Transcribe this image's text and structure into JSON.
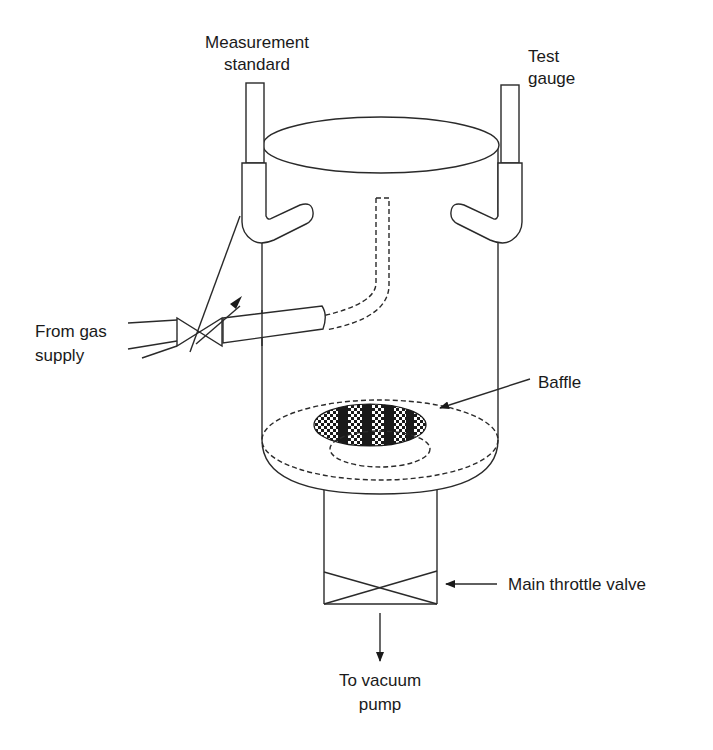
{
  "diagram": {
    "labels": {
      "measurement_standard_line1": "Measurement",
      "measurement_standard_line2": "standard",
      "test_gauge_line1": "Test",
      "test_gauge_line2": "gauge",
      "gas_supply_line1": "From gas",
      "gas_supply_line2": "supply",
      "baffle": "Baffle",
      "throttle_valve": "Main throttle valve",
      "vacuum_pump_line1": "To vacuum",
      "vacuum_pump_line2": "pump"
    },
    "components": [
      {
        "id": "chamber",
        "name": "Cylindrical vacuum chamber"
      },
      {
        "id": "measurement-standard-port",
        "name": "Measurement standard gauge port"
      },
      {
        "id": "test-gauge-port",
        "name": "Test gauge port"
      },
      {
        "id": "gas-inlet-valve",
        "name": "Variable leak valve"
      },
      {
        "id": "gas-inlet-tube",
        "name": "Gas inlet tube"
      },
      {
        "id": "baffle",
        "name": "Baffle"
      },
      {
        "id": "outlet-tube",
        "name": "Pump outlet tube"
      },
      {
        "id": "main-throttle-valve",
        "name": "Main throttle valve"
      }
    ],
    "colors": {
      "line": "#2a2a2a",
      "background": "#ffffff",
      "baffle_fill": "#1a1a1a"
    }
  }
}
